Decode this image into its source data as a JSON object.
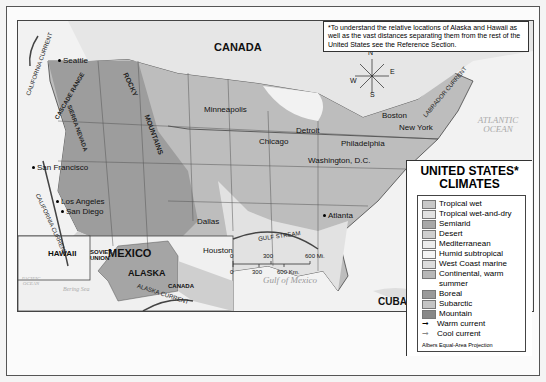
{
  "note": "*To understand the relative locations of Alaska and Hawaii as well as the vast distances separating them from the rest of the United States see the Reference Section.",
  "legend": {
    "title_line1": "UNITED STATES*",
    "title_line2": "CLIMATES",
    "items": [
      {
        "label": "Tropical wet",
        "color": "#c8c8c8"
      },
      {
        "label": "Tropical wet-and-dry",
        "color": "#e2e2e2"
      },
      {
        "label": "Semiarid",
        "color": "#a8a8a8"
      },
      {
        "label": "Desert",
        "color": "#cfcfcf"
      },
      {
        "label": "Mediterranean",
        "color": "#ececec"
      },
      {
        "label": "Humid subtropical",
        "color": "#f4f4f4"
      },
      {
        "label": "West Coast marine",
        "color": "#dcdcdc"
      },
      {
        "label": "Continental, warm summer",
        "color": "#b8b8b8"
      },
      {
        "label": "Boreal",
        "color": "#9a9a9a"
      },
      {
        "label": "Subarctic",
        "color": "#c4c4c4"
      },
      {
        "label": "Mountain",
        "color": "#888888"
      }
    ],
    "currents": [
      {
        "label": "Warm current",
        "symbol": "arrow-warm"
      },
      {
        "label": "Cool current",
        "symbol": "arrow-cool"
      }
    ],
    "projection": "Albers Equal-Area Projection"
  },
  "countries": {
    "canada": "CANADA",
    "mexico": "MEXICO",
    "cuba": "CUBA",
    "soviet_union": "SOVIET UNION",
    "canada_ak": "CANADA"
  },
  "states": {
    "hawaii": "HAWAII",
    "alaska": "ALASKA"
  },
  "cities": [
    "Seattle",
    "San Francisco",
    "Los Angeles",
    "San Diego",
    "Minneapolis",
    "Chicago",
    "Detroit",
    "Boston",
    "New York",
    "Philadelphia",
    "Washington, D.C.",
    "Dallas",
    "Houston",
    "Atlanta"
  ],
  "oceans": {
    "atlantic": "ATLANTIC OCEAN",
    "pacific": "PACIFIC OCEAN",
    "gulf": "Gulf of Mexico",
    "bering": "Bering Sea"
  },
  "ranges": {
    "cascade": "CASCADE RANGE",
    "sierra": "SIERRA NEVADA",
    "rocky": "ROCKY",
    "mountains": "MOUNTAINS"
  },
  "currents": {
    "california_n": "CALIFORNIA CURRENT",
    "california_s": "CALIFORNIA CURRENT",
    "labrador": "LABRADOR CURRENT",
    "gulf_stream_e": "GULF STREAM",
    "gulf_stream_s": "GULF STREAM",
    "alaska": "ALASKA CURRENT"
  },
  "compass": {
    "n": "N",
    "s": "S",
    "e": "E",
    "w": "W"
  },
  "scale": {
    "mi": [
      "0",
      "300",
      "600 Mi."
    ],
    "km": [
      "0",
      "300",
      "600 Km."
    ]
  },
  "graticule": [
    "110°",
    "90°",
    "40°",
    "30°",
    "120°",
    "160°",
    "20°",
    "160°",
    "140°",
    "90°",
    "80°"
  ]
}
